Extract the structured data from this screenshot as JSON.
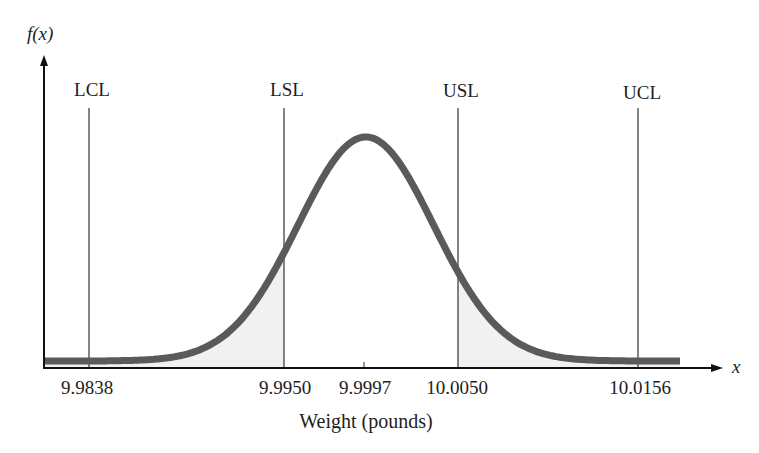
{
  "chart_data": {
    "type": "area",
    "title": "",
    "xlabel": "Weight (pounds)",
    "ylabel": "f(x)",
    "x_axis_symbol": "x",
    "distribution": {
      "kind": "normal",
      "mean": 9.9997,
      "approx_sd": 0.0039
    },
    "tick_labels": [
      "9.9838",
      "9.9950",
      "9.9997",
      "10.0050",
      "10.0156"
    ],
    "ticks": [
      9.9838,
      9.995,
      9.9997,
      10.005,
      10.0156
    ],
    "reference_lines": [
      {
        "name": "LCL",
        "x": 9.9838
      },
      {
        "name": "LSL",
        "x": 9.995
      },
      {
        "name": "USL",
        "x": 10.005
      },
      {
        "name": "UCL",
        "x": 10.0156
      }
    ],
    "shaded_regions": [
      {
        "from": "left end",
        "to": 9.995,
        "meaning": "below LSL"
      },
      {
        "from": 10.005,
        "to": "right end",
        "meaning": "above USL"
      }
    ],
    "grid": false,
    "legend": "none"
  },
  "labels": {
    "y_axis": "f(x)",
    "x_axis": "x",
    "x_title": "Weight (pounds)",
    "lcl": "LCL",
    "lsl": "LSL",
    "usl": "USL",
    "ucl": "UCL",
    "tick_lcl": "9.9838",
    "tick_lsl": "9.9950",
    "tick_mean": "9.9997",
    "tick_usl": "10.0050",
    "tick_ucl": "10.0156"
  },
  "colors": {
    "curve": "#5a5a5a",
    "shade": "#f1f1f1",
    "axis": "#111111",
    "ref_line": "#333333"
  }
}
